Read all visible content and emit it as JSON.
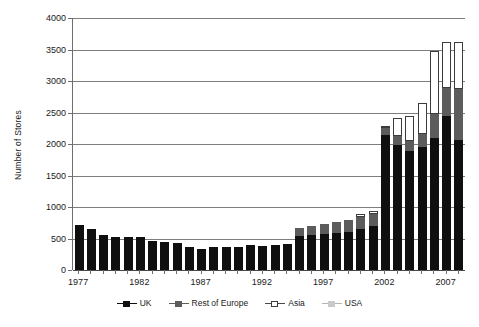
{
  "chart_data": {
    "type": "bar",
    "subtype": "stacked",
    "title": "",
    "xlabel": "",
    "ylabel": "Number of Stores",
    "ylim": [
      0,
      4000
    ],
    "ytick_values": [
      0,
      500,
      1000,
      1500,
      2000,
      2500,
      3000,
      3500,
      4000
    ],
    "ytick_labels": [
      "0",
      "500",
      "1000",
      "1500",
      "2000",
      "2500",
      "3000",
      "3500",
      "4000"
    ],
    "grid": true,
    "legend_position": "bottom",
    "categories": [
      "1977",
      "1978",
      "1979",
      "1980",
      "1981",
      "1982",
      "1983",
      "1984",
      "1985",
      "1986",
      "1987",
      "1988",
      "1989",
      "1990",
      "1991",
      "1992",
      "1993",
      "1994",
      "1995",
      "1996",
      "1997",
      "1998",
      "1999",
      "2000",
      "2001",
      "2002",
      "2003",
      "2004",
      "2005",
      "2006",
      "2007",
      "2008"
    ],
    "xtick_labels": [
      "1977",
      "1982",
      "1987",
      "1992",
      "1997",
      "2002",
      "2007"
    ],
    "xtick_categories": [
      "1977",
      "1982",
      "1987",
      "1992",
      "1997",
      "2002",
      "2007"
    ],
    "series": [
      {
        "name": "UK",
        "color": "#0f0f0f",
        "values": [
          720,
          655,
          560,
          525,
          520,
          520,
          465,
          440,
          435,
          370,
          340,
          365,
          365,
          360,
          390,
          385,
          390,
          410,
          545,
          560,
          570,
          590,
          610,
          650,
          700,
          2150,
          1990,
          1890,
          1960,
          2090,
          2440,
          2070
        ]
      },
      {
        "name": "Rest of Europe",
        "color": "#5c5c5c",
        "values": [
          0,
          0,
          0,
          0,
          0,
          0,
          0,
          0,
          0,
          0,
          0,
          0,
          0,
          0,
          0,
          0,
          0,
          0,
          120,
          140,
          160,
          175,
          185,
          195,
          185,
          110,
          135,
          160,
          200,
          380,
          450,
          800
        ]
      },
      {
        "name": "Asia",
        "color": "#ffffff",
        "values": [
          0,
          0,
          0,
          0,
          0,
          0,
          0,
          0,
          0,
          0,
          0,
          0,
          0,
          0,
          0,
          0,
          0,
          0,
          0,
          0,
          0,
          0,
          0,
          40,
          60,
          30,
          295,
          400,
          490,
          1000,
          730,
          745
        ]
      },
      {
        "name": "USA",
        "color": "#c9c9c9",
        "values": [
          0,
          0,
          0,
          0,
          0,
          0,
          0,
          0,
          0,
          0,
          0,
          0,
          0,
          0,
          0,
          0,
          0,
          0,
          0,
          0,
          0,
          0,
          0,
          0,
          0,
          0,
          0,
          0,
          0,
          0,
          0,
          0
        ]
      }
    ],
    "totals": [
      720,
      655,
      560,
      525,
      520,
      520,
      465,
      440,
      435,
      370,
      340,
      365,
      365,
      360,
      390,
      385,
      390,
      410,
      665,
      700,
      730,
      765,
      795,
      885,
      945,
      2290,
      2420,
      2450,
      2650,
      3470,
      3620,
      3615
    ]
  },
  "legend": {
    "entries": [
      {
        "label": "UK",
        "marker": "square-filled-black"
      },
      {
        "label": "Rest of Europe",
        "marker": "square-filled-gray"
      },
      {
        "label": "Asia",
        "marker": "square-open-white"
      },
      {
        "label": "USA",
        "marker": "square-filled-lightgray"
      }
    ]
  }
}
